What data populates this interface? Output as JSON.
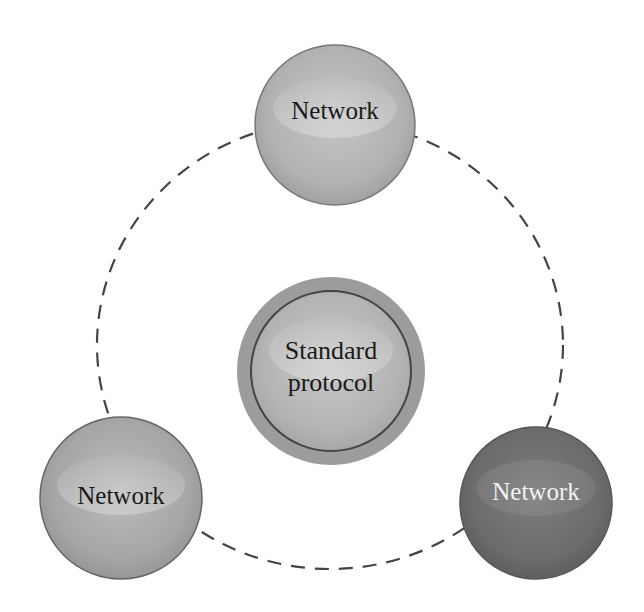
{
  "diagram": {
    "center_node": {
      "label_line1": "Standard",
      "label_line2": "protocol"
    },
    "nodes": [
      {
        "id": "top",
        "label": "Network"
      },
      {
        "id": "bottom-left",
        "label": "Network"
      },
      {
        "id": "bottom-right",
        "label": "Network"
      }
    ],
    "colors": {
      "background": "#ffffff",
      "dashed_ring": "#444444",
      "top_node": "#b4b4b4",
      "bottom_left_node": "#a8a8a8",
      "bottom_right_node": "#6e6e6e",
      "center_outer": "#9a9a9a",
      "center_inner": "#b8b8b8",
      "node_border": "#666666"
    }
  }
}
